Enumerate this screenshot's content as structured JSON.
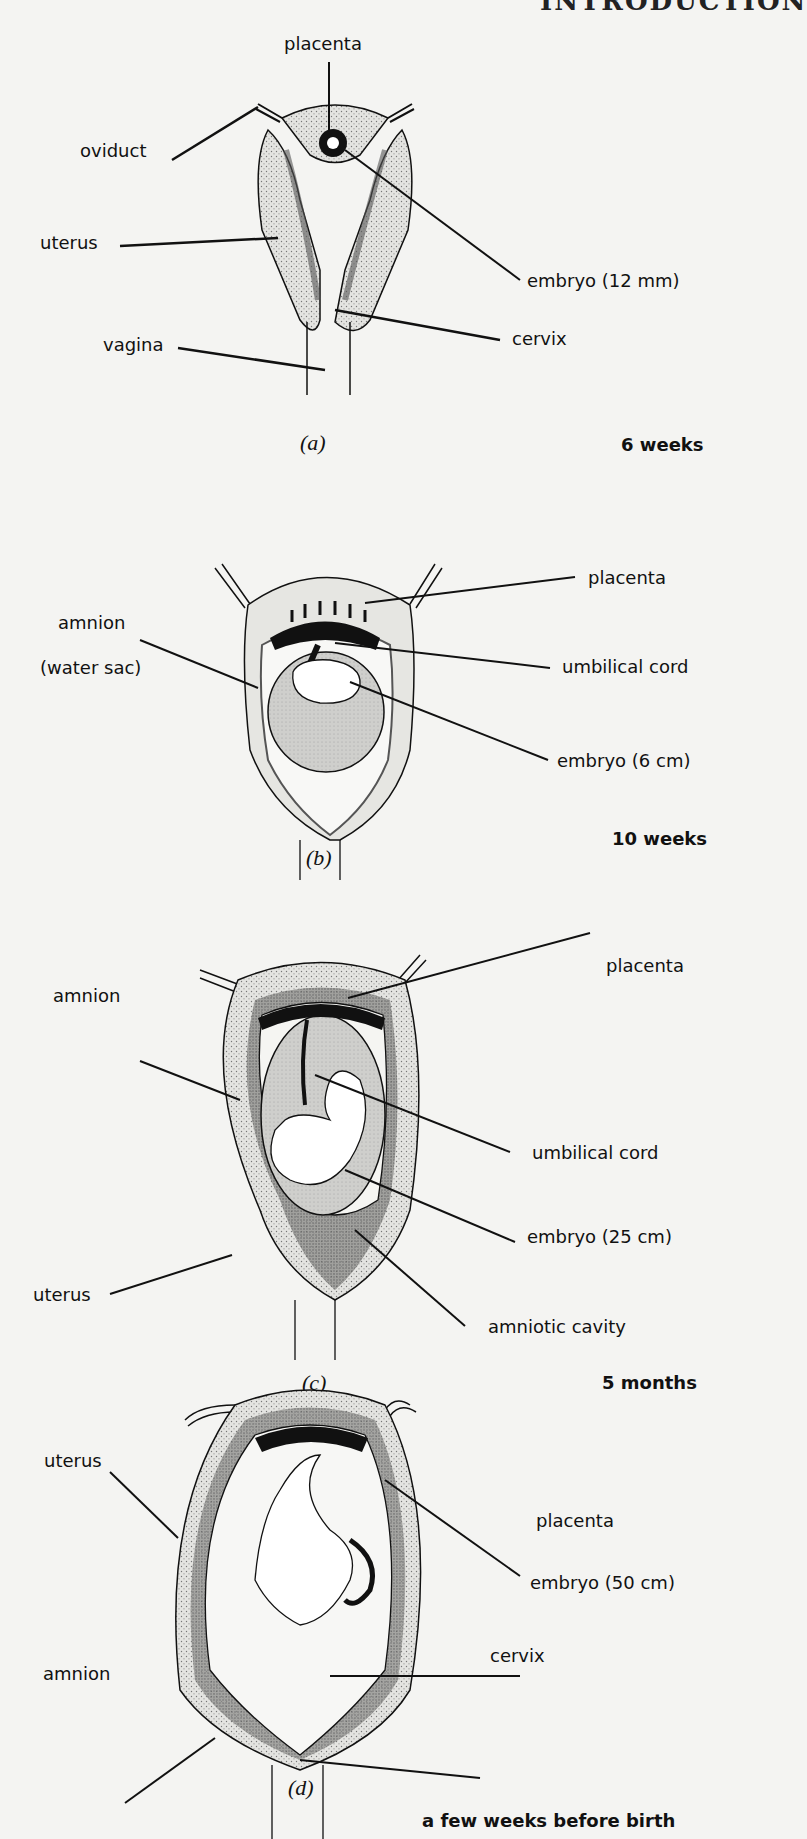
{
  "header": {
    "title": "INTRODUCTION"
  },
  "panels": [
    {
      "id": "a",
      "caption": "(a)",
      "stage": "6 weeks",
      "labels": {
        "placenta": "placenta",
        "oviduct": "oviduct",
        "uterus": "uterus",
        "embryo": "embryo (12 mm)",
        "cervix": "cervix",
        "vagina": "vagina"
      }
    },
    {
      "id": "b",
      "caption": "(b)",
      "stage": "10 weeks",
      "labels": {
        "placenta": "placenta",
        "amnion": "amnion",
        "amnion_note": "(water sac)",
        "umbilical_cord": "umbilical cord",
        "embryo": "embryo (6 cm)"
      }
    },
    {
      "id": "c",
      "caption": "(c)",
      "stage": "5 months",
      "labels": {
        "placenta": "placenta",
        "amnion": "amnion",
        "umbilical_cord": "umbilical cord",
        "embryo": "embryo (25 cm)",
        "uterus": "uterus",
        "amniotic_cavity": "amniotic cavity"
      }
    },
    {
      "id": "d",
      "caption": "(d)",
      "stage": "a few weeks before birth",
      "labels": {
        "uterus": "uterus",
        "placenta": "placenta",
        "embryo": "embryo (50 cm)",
        "amnion": "amnion",
        "cervix": "cervix"
      }
    }
  ]
}
